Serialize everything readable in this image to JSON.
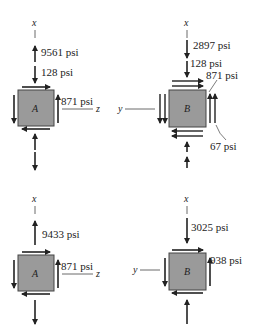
{
  "colors": {
    "element_fill": "#9a9a9a",
    "element_border": "#444444",
    "ink": "#222222"
  },
  "panels": [
    {
      "id": "A-top",
      "element_label": "A",
      "axis_vertical": "x",
      "axis_horizontal": "z",
      "stresses": {
        "axial_1": "9561 psi",
        "axial_2": "128 psi",
        "shear": "871 psi"
      }
    },
    {
      "id": "B-top",
      "element_label": "B",
      "axis_vertical": "x",
      "axis_horizontal": "y",
      "stresses": {
        "axial_1": "2897 psi",
        "axial_2": "128 psi",
        "shear_1": "871 psi",
        "shear_2": "67 psi"
      }
    },
    {
      "id": "A-bottom",
      "element_label": "A",
      "axis_vertical": "x",
      "axis_horizontal": "z",
      "stresses": {
        "axial": "9433 psi",
        "shear": "871 psi"
      }
    },
    {
      "id": "B-bottom",
      "element_label": "B",
      "axis_vertical": "x",
      "axis_horizontal": "y",
      "stresses": {
        "axial": "3025 psi",
        "shear": "938 psi"
      }
    }
  ]
}
